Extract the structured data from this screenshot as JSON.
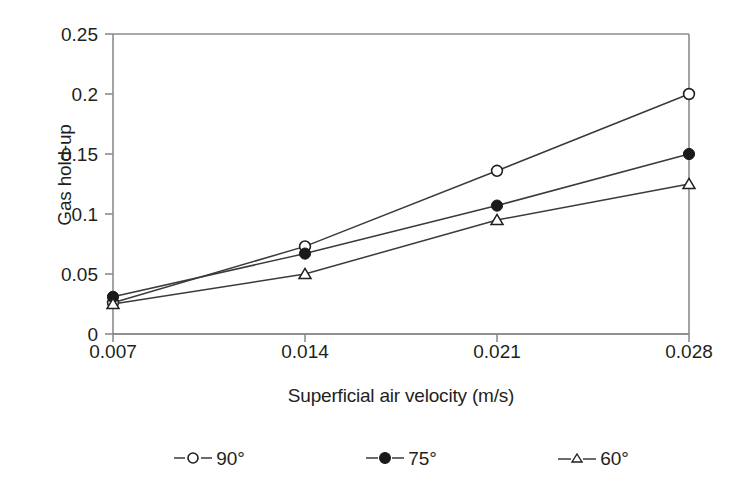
{
  "chart_data": {
    "type": "line",
    "title": "",
    "xlabel": "Superficial air velocity (m/s)",
    "ylabel": "Gas hold-up",
    "x": [
      0.007,
      0.014,
      0.021,
      0.028
    ],
    "xtick_labels": [
      "0.007",
      "0.014",
      "0.021",
      "0.028"
    ],
    "ytick_labels": [
      "0",
      "0.05",
      "0.1",
      "0.15",
      "0.2",
      "0.25"
    ],
    "ytick_values": [
      0,
      0.05,
      0.1,
      0.15,
      0.2,
      0.25
    ],
    "xlim": [
      0.007,
      0.028
    ],
    "ylim": [
      0,
      0.25
    ],
    "grid": false,
    "legend_position": "bottom",
    "series": [
      {
        "name": "90°",
        "marker": "open-circle",
        "color": "#231f20",
        "values": [
          0.026,
          0.073,
          0.136,
          0.2
        ]
      },
      {
        "name": "75°",
        "marker": "filled-circle",
        "color": "#231f20",
        "values": [
          0.031,
          0.067,
          0.107,
          0.15
        ]
      },
      {
        "name": "60°",
        "marker": "open-triangle",
        "color": "#231f20",
        "values": [
          0.025,
          0.05,
          0.095,
          0.125
        ]
      }
    ]
  },
  "axes": {
    "y_title": "Gas hold-up",
    "x_title": "Superficial air velocity (m/s)",
    "y_ticks": [
      {
        "label": "0.25"
      },
      {
        "label": "0.2"
      },
      {
        "label": "0.15"
      },
      {
        "label": "0.1"
      },
      {
        "label": "0.05"
      },
      {
        "label": "0"
      }
    ],
    "x_ticks": [
      {
        "label": "0.007"
      },
      {
        "label": "0.014"
      },
      {
        "label": "0.021"
      },
      {
        "label": "0.028"
      }
    ]
  },
  "legend": {
    "items": [
      {
        "label": "90°",
        "marker": "open-circle-icon"
      },
      {
        "label": "75°",
        "marker": "filled-circle-icon"
      },
      {
        "label": "60°",
        "marker": "open-triangle-icon"
      }
    ]
  },
  "colors": {
    "ink": "#231f20",
    "axis": "#808080",
    "series_line": "#3a3a3a",
    "background": "#ffffff"
  }
}
